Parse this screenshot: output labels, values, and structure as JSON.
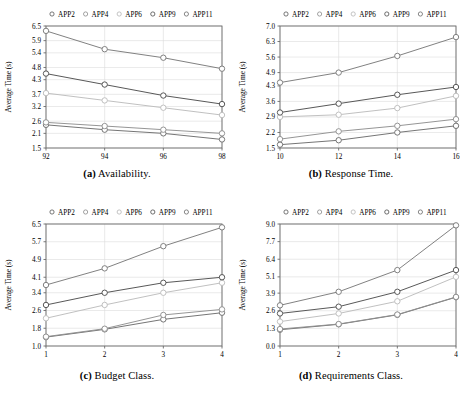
{
  "figure": {
    "title": "",
    "panels": [
      {
        "panel_label": "(a)",
        "caption": "Availability.",
        "chart_data": {
          "type": "line",
          "title": "",
          "xlabel": "",
          "ylabel": "Average Time (s)",
          "x": [
            92,
            94,
            96,
            98
          ],
          "xticks": [
            92,
            94,
            96,
            98
          ],
          "yticks": [
            1.5,
            2.1,
            2.6,
            3.2,
            3.7,
            4.3,
            4.8,
            5.4,
            5.9,
            6.5
          ],
          "ylim": [
            1.5,
            6.5
          ],
          "xlim": [
            92,
            98
          ],
          "grid": true,
          "legend_position": "top",
          "series": [
            {
              "name": "APP2",
              "values": [
                2.45,
                2.25,
                2.1,
                1.85
              ]
            },
            {
              "name": "APP4",
              "values": [
                2.55,
                2.4,
                2.25,
                2.1
              ]
            },
            {
              "name": "APP6",
              "values": [
                3.75,
                3.45,
                3.15,
                2.85
              ]
            },
            {
              "name": "APP9",
              "values": [
                4.55,
                4.1,
                3.65,
                3.3
              ]
            },
            {
              "name": "APP11",
              "values": [
                6.3,
                5.55,
                5.2,
                4.75
              ]
            }
          ]
        }
      },
      {
        "panel_label": "(b)",
        "caption": "Response Time.",
        "chart_data": {
          "type": "line",
          "title": "",
          "xlabel": "",
          "ylabel": "Average Time (s)",
          "x": [
            10,
            12,
            14,
            16
          ],
          "xticks": [
            10,
            12,
            14,
            16
          ],
          "yticks": [
            1.5,
            2.2,
            2.9,
            3.6,
            4.3,
            4.9,
            5.6,
            6.3,
            7.0
          ],
          "ylim": [
            1.5,
            7.0
          ],
          "xlim": [
            10,
            16
          ],
          "grid": true,
          "legend_position": "top",
          "series": [
            {
              "name": "APP2",
              "values": [
                1.65,
                1.85,
                2.2,
                2.5
              ]
            },
            {
              "name": "APP4",
              "values": [
                1.9,
                2.25,
                2.5,
                2.8
              ]
            },
            {
              "name": "APP6",
              "values": [
                2.9,
                3.0,
                3.3,
                3.85
              ]
            },
            {
              "name": "APP9",
              "values": [
                3.1,
                3.5,
                3.9,
                4.25
              ]
            },
            {
              "name": "APP11",
              "values": [
                4.45,
                4.9,
                5.65,
                6.5
              ]
            }
          ]
        }
      },
      {
        "panel_label": "(c)",
        "caption": "Budget Class.",
        "chart_data": {
          "type": "line",
          "title": "",
          "xlabel": "",
          "ylabel": "Average Time (s)",
          "x": [
            1,
            2,
            3,
            4
          ],
          "xticks": [
            1,
            2,
            3,
            4
          ],
          "yticks": [
            1.0,
            1.8,
            2.6,
            3.4,
            4.1,
            4.9,
            5.7,
            6.5
          ],
          "ylim": [
            1.0,
            6.5
          ],
          "xlim": [
            1,
            4
          ],
          "grid": true,
          "legend_position": "top",
          "series": [
            {
              "name": "APP2",
              "values": [
                1.4,
                1.75,
                2.2,
                2.5
              ]
            },
            {
              "name": "APP4",
              "values": [
                1.42,
                1.78,
                2.4,
                2.65
              ]
            },
            {
              "name": "APP6",
              "values": [
                2.25,
                2.85,
                3.4,
                3.85
              ]
            },
            {
              "name": "APP9",
              "values": [
                2.85,
                3.4,
                3.85,
                4.1
              ]
            },
            {
              "name": "APP11",
              "values": [
                3.75,
                4.5,
                5.5,
                6.35
              ]
            }
          ]
        }
      },
      {
        "panel_label": "(d)",
        "caption": "Requirements Class.",
        "chart_data": {
          "type": "line",
          "title": "",
          "xlabel": "",
          "ylabel": "Average Time (s)",
          "x": [
            1,
            2,
            3,
            4
          ],
          "xticks": [
            1,
            2,
            3,
            4
          ],
          "yticks": [
            0.0,
            1.3,
            2.6,
            3.9,
            5.1,
            6.4,
            7.7,
            9.0
          ],
          "ylim": [
            0.0,
            9.0
          ],
          "xlim": [
            1,
            4
          ],
          "grid": true,
          "legend_position": "top",
          "series": [
            {
              "name": "APP2",
              "values": [
                1.2,
                1.6,
                2.3,
                3.6
              ]
            },
            {
              "name": "APP4",
              "values": [
                1.25,
                1.62,
                2.32,
                3.62
              ]
            },
            {
              "name": "APP6",
              "values": [
                1.8,
                2.4,
                3.3,
                5.1
              ]
            },
            {
              "name": "APP9",
              "values": [
                2.4,
                2.9,
                4.0,
                5.6
              ]
            },
            {
              "name": "APP11",
              "values": [
                3.0,
                4.0,
                5.6,
                8.9
              ]
            }
          ]
        }
      }
    ],
    "legend": {
      "entries": [
        {
          "label": "APP2",
          "marker": "circle-marker",
          "color": "#555555"
        },
        {
          "label": "APP4",
          "marker": "circle-marker",
          "color": "#8a8a8a"
        },
        {
          "label": "APP6",
          "marker": "circle-marker",
          "color": "#b5b5b5"
        },
        {
          "label": "APP9",
          "marker": "circle-marker",
          "color": "#4a4a4a"
        },
        {
          "label": "APP11",
          "marker": "circle-marker",
          "color": "#6a6a6a"
        }
      ]
    },
    "colors": {
      "APP2": "#6e6e6e",
      "APP4": "#8f8f8f",
      "APP6": "#bdbdbd",
      "APP9": "#4f4f4f",
      "APP11": "#7a7a7a",
      "grid": "#dcdcdc",
      "axis": "#6b6b6b",
      "text": "#000000"
    }
  }
}
